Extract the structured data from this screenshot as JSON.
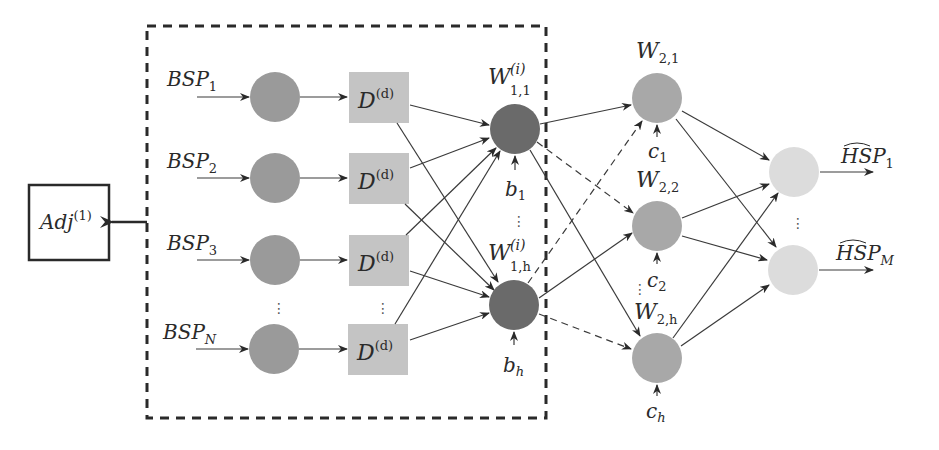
{
  "diagram": {
    "colors": {
      "input_node": "#9a9a9a",
      "delay_block": "#c4c4c4",
      "hidden1_node": "#6a6a6a",
      "hidden2_node": "#a8a8a8",
      "output_node": "#dcdcdc",
      "edge": "#3a3a3a",
      "dashed_box": "#2a2a2a"
    },
    "adj_box": {
      "label": "Adj",
      "superscript": "(1)"
    },
    "inputs": [
      {
        "label": "BSP",
        "subscript": "1"
      },
      {
        "label": "BSP",
        "subscript": "2"
      },
      {
        "label": "BSP",
        "subscript": "3"
      },
      {
        "label": "BSP",
        "subscript": "N"
      }
    ],
    "delay_blocks": [
      {
        "label": "D",
        "superscript": "(d)"
      },
      {
        "label": "D",
        "superscript": "(d)"
      },
      {
        "label": "D",
        "superscript": "(d)"
      },
      {
        "label": "D",
        "superscript": "(d)"
      }
    ],
    "hidden_layer_1": [
      {
        "label": "W",
        "superscript": "(i)",
        "subscript": "1,1",
        "bias": "b",
        "bias_sub": "1"
      },
      {
        "label": "W",
        "superscript": "(i)",
        "subscript": "1,h",
        "bias": "b",
        "bias_sub": "h"
      }
    ],
    "hidden_layer_2": [
      {
        "label": "W",
        "subscript": "2,1",
        "bias": "c",
        "bias_sub": "1"
      },
      {
        "label": "W",
        "subscript": "2,2",
        "bias": "c",
        "bias_sub": "2"
      },
      {
        "label": "W",
        "subscript": "2,h",
        "bias": "c",
        "bias_sub": "h"
      }
    ],
    "outputs": [
      {
        "label": "HSP",
        "subscript": "1",
        "hat": true
      },
      {
        "label": "HSP",
        "subscript": "M",
        "hat": true
      }
    ],
    "ellipsis": "⋮"
  }
}
